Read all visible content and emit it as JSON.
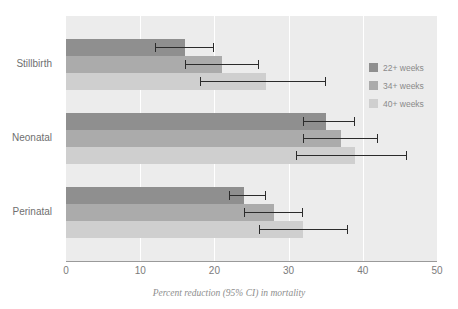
{
  "figure": {
    "top_title": "",
    "caption": "Percent reduction (95% CI) in mortality"
  },
  "legend": {
    "position": "right-top",
    "items": [
      {
        "label": "22+ weeks",
        "color": "#8f8f8f"
      },
      {
        "label": "34+ weeks",
        "color": "#ababab"
      },
      {
        "label": "40+ weeks",
        "color": "#cfcfcf"
      }
    ]
  },
  "axis": {
    "x_ticks": [
      "0",
      "10",
      "20",
      "30",
      "40",
      "50"
    ],
    "y_categories": [
      "Stillbirth",
      "Neonatal",
      "Perinatal"
    ]
  },
  "chart_data": {
    "type": "bar",
    "orientation": "horizontal",
    "title": "",
    "xlabel": "Percent reduction (95% CI) in mortality",
    "ylabel": "",
    "xlim": [
      0,
      50
    ],
    "xticks": [
      0,
      10,
      20,
      30,
      40,
      50
    ],
    "grid": "vertical-white-gridlines",
    "legend_position": "right-top",
    "categories": [
      "Stillbirth",
      "Neonatal",
      "Perinatal"
    ],
    "series": [
      {
        "name": "22+ weeks",
        "color": "#8f8f8f",
        "values": [
          16,
          35,
          24
        ],
        "ci_low": [
          12,
          32,
          22
        ],
        "ci_high": [
          20,
          39,
          27
        ]
      },
      {
        "name": "34+ weeks",
        "color": "#ababab",
        "values": [
          21,
          37,
          28
        ],
        "ci_low": [
          16,
          32,
          24
        ],
        "ci_high": [
          26,
          42,
          32
        ]
      },
      {
        "name": "40+ weeks",
        "color": "#cfcfcf",
        "values": [
          27,
          39,
          32
        ],
        "ci_low": [
          18,
          31,
          26
        ],
        "ci_high": [
          35,
          46,
          38
        ]
      }
    ]
  }
}
